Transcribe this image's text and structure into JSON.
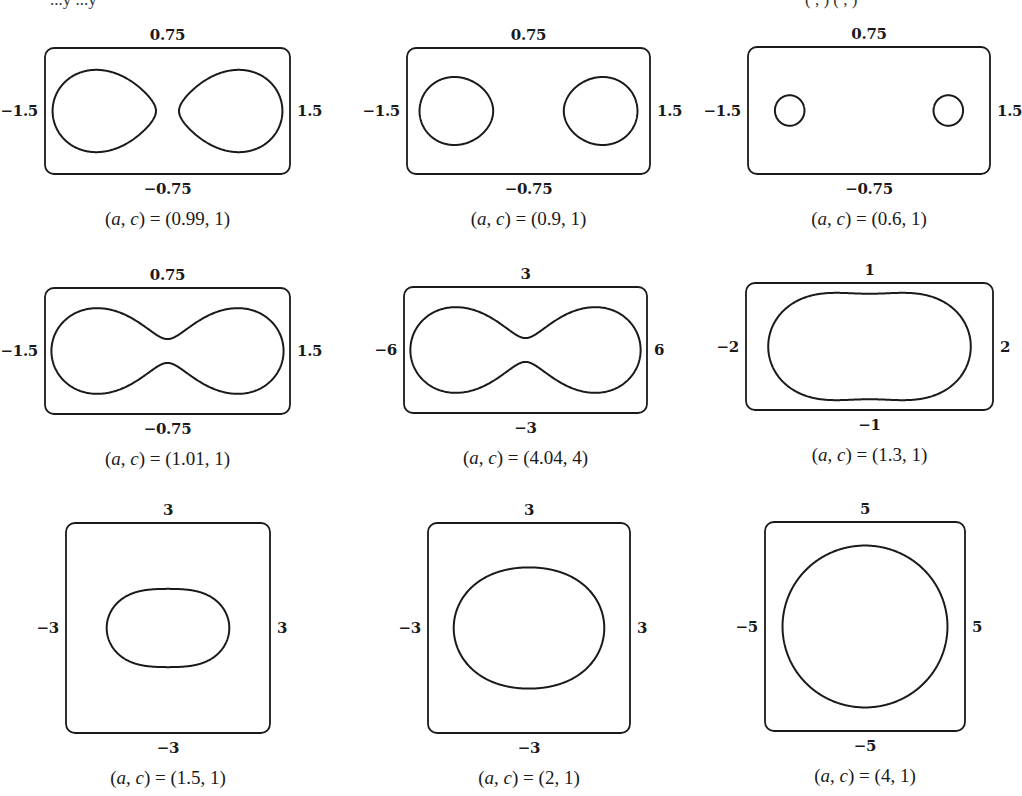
{
  "header_fragment": {
    "left_text": "...y ...y",
    "right_text": "( , ) ( , )"
  },
  "panels": [
    {
      "caption_params": "(0.99, 1)",
      "a": 0.99,
      "c": 1,
      "labels": {
        "top": "0.75",
        "bottom": "−0.75",
        "left": "−1.5",
        "right": "1.5"
      },
      "xlim": [
        -1.5,
        1.5
      ],
      "ylim": [
        -0.75,
        0.75
      ],
      "box": {
        "x": 45,
        "y": 48,
        "w": 245,
        "h": 126
      }
    },
    {
      "caption_params": "(0.9, 1)",
      "a": 0.9,
      "c": 1,
      "labels": {
        "top": "0.75",
        "bottom": "−0.75",
        "left": "−1.5",
        "right": "1.5"
      },
      "xlim": [
        -1.5,
        1.5
      ],
      "ylim": [
        -0.75,
        0.75
      ],
      "box": {
        "x": 407,
        "y": 48,
        "w": 243,
        "h": 126
      }
    },
    {
      "caption_params": "(0.6, 1)",
      "a": 0.6,
      "c": 1,
      "labels": {
        "top": "0.75",
        "bottom": "−0.75",
        "left": "−1.5",
        "right": "1.5"
      },
      "xlim": [
        -1.5,
        1.5
      ],
      "ylim": [
        -0.75,
        0.75
      ],
      "box": {
        "x": 748,
        "y": 47,
        "w": 242,
        "h": 127
      }
    },
    {
      "caption_params": "(1.01, 1)",
      "a": 1.01,
      "c": 1,
      "labels": {
        "top": "0.75",
        "bottom": "−0.75",
        "left": "−1.5",
        "right": "1.5"
      },
      "xlim": [
        -1.5,
        1.5
      ],
      "ylim": [
        -0.75,
        0.75
      ],
      "box": {
        "x": 45,
        "y": 288,
        "w": 245,
        "h": 126
      }
    },
    {
      "caption_params": "(4.04, 4)",
      "a": 4.04,
      "c": 4,
      "labels": {
        "top": "3",
        "bottom": "−3",
        "left": "−6",
        "right": "6"
      },
      "xlim": [
        -6,
        6
      ],
      "ylim": [
        -3,
        3
      ],
      "box": {
        "x": 404,
        "y": 287,
        "w": 243,
        "h": 126
      }
    },
    {
      "caption_params": "(1.3, 1)",
      "a": 1.3,
      "c": 1,
      "labels": {
        "top": "1",
        "bottom": "−1",
        "left": "−2",
        "right": "2"
      },
      "xlim": [
        -2,
        2
      ],
      "ylim": [
        -1,
        1
      ],
      "box": {
        "x": 746,
        "y": 283,
        "w": 247,
        "h": 127
      }
    },
    {
      "caption_params": "(1.5, 1)",
      "a": 1.5,
      "c": 1,
      "labels": {
        "top": "3",
        "bottom": "−3",
        "left": "−3",
        "right": "3"
      },
      "xlim": [
        -3,
        3
      ],
      "ylim": [
        -3,
        3
      ],
      "box": {
        "x": 66,
        "y": 523,
        "w": 204,
        "h": 210
      }
    },
    {
      "caption_params": "(2, 1)",
      "a": 2,
      "c": 1,
      "labels": {
        "top": "3",
        "bottom": "−3",
        "left": "−3",
        "right": "3"
      },
      "xlim": [
        -3,
        3
      ],
      "ylim": [
        -3,
        3
      ],
      "box": {
        "x": 428,
        "y": 523,
        "w": 202,
        "h": 210
      }
    },
    {
      "caption_params": "(4, 1)",
      "a": 4,
      "c": 1,
      "labels": {
        "top": "5",
        "bottom": "−5",
        "left": "−5",
        "right": "5"
      },
      "xlim": [
        -5,
        5
      ],
      "ylim": [
        -5,
        5
      ],
      "box": {
        "x": 765,
        "y": 522,
        "w": 200,
        "h": 209
      }
    }
  ],
  "caption_prefix": "(a, c) = ",
  "colors": {
    "stroke": "#1a1a1a",
    "background": "#ffffff"
  }
}
